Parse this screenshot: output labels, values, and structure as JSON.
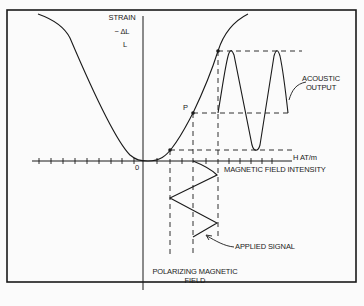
{
  "diagram": {
    "y_axis": {
      "label_line1": "STRAIN",
      "label_line2": "− ΔL",
      "label_line3": "L"
    },
    "x_axis": {
      "unit_label": "H AT/m",
      "caption": "MAGNETIC FIELD INTENSITY",
      "origin_label": "0"
    },
    "point_label": "P",
    "annotations": {
      "acoustic_output_line1": "ACOUSTIC",
      "acoustic_output_line2": "OUTPUT",
      "applied_signal": "APPLIED SIGNAL",
      "polarizing_line1": "POLARIZING  MAGNETIC",
      "polarizing_line2": "FIELD"
    },
    "colors": {
      "line": "#1a1a1a",
      "background": "#fbfbfb"
    }
  }
}
